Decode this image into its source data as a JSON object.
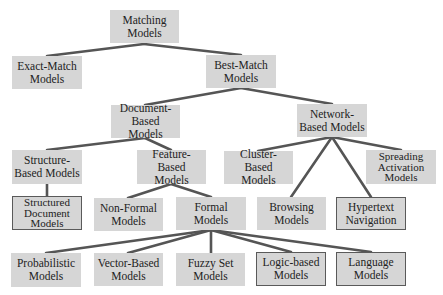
{
  "diagram": {
    "colors": {
      "box_fill": "#d6d6d6",
      "edge": "#555555",
      "outline": "#5a5a5a",
      "text": "#222222"
    },
    "nodes": [
      {
        "id": "matching",
        "label": "Matching\nModels",
        "x": 110,
        "y": 10,
        "w": 69,
        "h": 33,
        "outlined": false
      },
      {
        "id": "exact",
        "label": "Exact-Match\nModels",
        "x": 12,
        "y": 56,
        "w": 70,
        "h": 33,
        "outlined": false
      },
      {
        "id": "best",
        "label": "Best-Match\nModels",
        "x": 206,
        "y": 55,
        "w": 70,
        "h": 33,
        "outlined": false
      },
      {
        "id": "document",
        "label": "Document-\nBased Models",
        "x": 111,
        "y": 105,
        "w": 69,
        "h": 33,
        "outlined": false
      },
      {
        "id": "network",
        "label": "Network-\nBased Models",
        "x": 297,
        "y": 104,
        "w": 70,
        "h": 33,
        "outlined": false
      },
      {
        "id": "structure",
        "label": "Structure-\nBased Models",
        "x": 12,
        "y": 150,
        "w": 70,
        "h": 34,
        "outlined": false
      },
      {
        "id": "feature",
        "label": "Feature-\nBased Models",
        "x": 137,
        "y": 150,
        "w": 69,
        "h": 34,
        "outlined": false
      },
      {
        "id": "cluster",
        "label": "Cluster-\nBased Models",
        "x": 224,
        "y": 151,
        "w": 69,
        "h": 33,
        "outlined": false
      },
      {
        "id": "spreading",
        "label": "Spreading\nActivation\nModels",
        "x": 366,
        "y": 150,
        "w": 70,
        "h": 34,
        "outlined": false,
        "tight": true
      },
      {
        "id": "structured",
        "label": "Structured\nDocument\nModels",
        "x": 12,
        "y": 196,
        "w": 70,
        "h": 34,
        "outlined": true,
        "tight": true
      },
      {
        "id": "nonformal",
        "label": "Non-Formal\nModels",
        "x": 94,
        "y": 198,
        "w": 69,
        "h": 33,
        "outlined": false
      },
      {
        "id": "formal",
        "label": "Formal\nModels",
        "x": 176,
        "y": 197,
        "w": 70,
        "h": 33,
        "outlined": false
      },
      {
        "id": "browsing",
        "label": "Browsing\nModels",
        "x": 257,
        "y": 197,
        "w": 69,
        "h": 33,
        "outlined": false
      },
      {
        "id": "hypertext",
        "label": "Hypertext\nNavigation",
        "x": 336,
        "y": 197,
        "w": 70,
        "h": 33,
        "outlined": true
      },
      {
        "id": "probabilistic",
        "label": "Probabilistic\nModels",
        "x": 11,
        "y": 253,
        "w": 70,
        "h": 34,
        "outlined": false
      },
      {
        "id": "vector",
        "label": "Vector-Based\nModels",
        "x": 94,
        "y": 253,
        "w": 69,
        "h": 33,
        "outlined": false
      },
      {
        "id": "fuzzy",
        "label": "Fuzzy Set\nModels",
        "x": 176,
        "y": 253,
        "w": 69,
        "h": 33,
        "outlined": false
      },
      {
        "id": "logic",
        "label": "Logic-based\nModels",
        "x": 256,
        "y": 252,
        "w": 70,
        "h": 34,
        "outlined": true
      },
      {
        "id": "language",
        "label": "Language\nModels",
        "x": 336,
        "y": 252,
        "w": 70,
        "h": 34,
        "outlined": true
      }
    ],
    "edges": [
      {
        "from": "matching",
        "to": "exact",
        "x1": 144,
        "y1": 44,
        "x2": 47,
        "y2": 56
      },
      {
        "from": "matching",
        "to": "best",
        "x1": 144,
        "y1": 44,
        "x2": 241,
        "y2": 55
      },
      {
        "from": "best",
        "to": "document",
        "x1": 241,
        "y1": 88,
        "x2": 145,
        "y2": 105
      },
      {
        "from": "best",
        "to": "network",
        "x1": 241,
        "y1": 88,
        "x2": 332,
        "y2": 104
      },
      {
        "from": "document",
        "to": "structure",
        "x1": 145,
        "y1": 138,
        "x2": 47,
        "y2": 150
      },
      {
        "from": "document",
        "to": "feature",
        "x1": 145,
        "y1": 138,
        "x2": 171,
        "y2": 150
      },
      {
        "from": "network",
        "to": "cluster",
        "x1": 332,
        "y1": 137,
        "x2": 258,
        "y2": 151
      },
      {
        "from": "network",
        "to": "spreading",
        "x1": 332,
        "y1": 137,
        "x2": 401,
        "y2": 150
      },
      {
        "from": "network",
        "to": "browsing",
        "x1": 332,
        "y1": 137,
        "x2": 291,
        "y2": 197
      },
      {
        "from": "network",
        "to": "hypertext",
        "x1": 332,
        "y1": 137,
        "x2": 371,
        "y2": 197
      },
      {
        "from": "structure",
        "to": "structured",
        "x1": 47,
        "y1": 184,
        "x2": 47,
        "y2": 196
      },
      {
        "from": "feature",
        "to": "nonformal",
        "x1": 171,
        "y1": 184,
        "x2": 128,
        "y2": 198
      },
      {
        "from": "feature",
        "to": "formal",
        "x1": 171,
        "y1": 184,
        "x2": 211,
        "y2": 197
      },
      {
        "from": "formal",
        "to": "probabilistic",
        "x1": 211,
        "y1": 230,
        "x2": 46,
        "y2": 253
      },
      {
        "from": "formal",
        "to": "vector",
        "x1": 211,
        "y1": 230,
        "x2": 128,
        "y2": 253
      },
      {
        "from": "formal",
        "to": "fuzzy",
        "x1": 211,
        "y1": 230,
        "x2": 211,
        "y2": 253
      },
      {
        "from": "formal",
        "to": "logic",
        "x1": 211,
        "y1": 230,
        "x2": 291,
        "y2": 252
      },
      {
        "from": "formal",
        "to": "language",
        "x1": 211,
        "y1": 230,
        "x2": 371,
        "y2": 252
      }
    ]
  }
}
